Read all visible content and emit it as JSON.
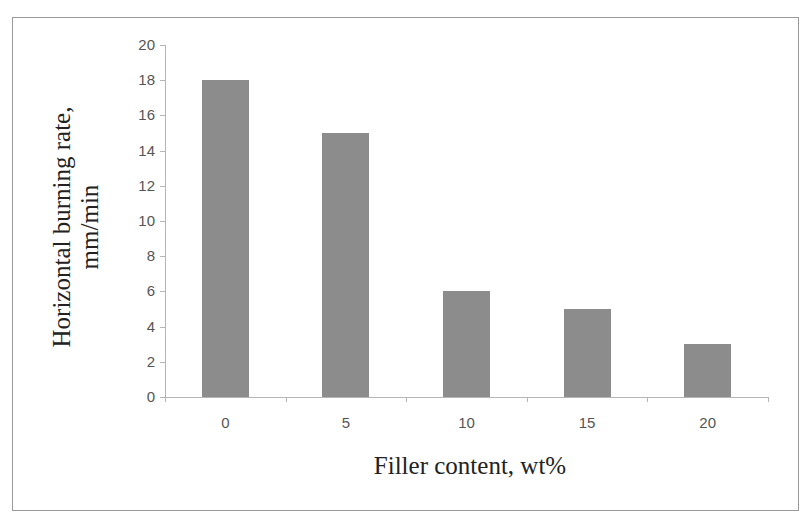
{
  "chart_data": {
    "type": "bar",
    "title": "",
    "xlabel": "Filler content, wt%",
    "ylabel": "Horizontal burning rate, mm/min",
    "ylabel_lines": [
      "Horizontal burning rate,",
      "mm/min"
    ],
    "categories": [
      "0",
      "5",
      "10",
      "15",
      "20"
    ],
    "values": [
      18,
      15,
      6,
      5,
      3
    ],
    "ylim": [
      0,
      20
    ],
    "yticks": [
      "0",
      "2",
      "4",
      "6",
      "8",
      "10",
      "12",
      "14",
      "16",
      "18",
      "20"
    ],
    "grid": false,
    "legend": null,
    "bar_color": "#8c8c8c"
  }
}
